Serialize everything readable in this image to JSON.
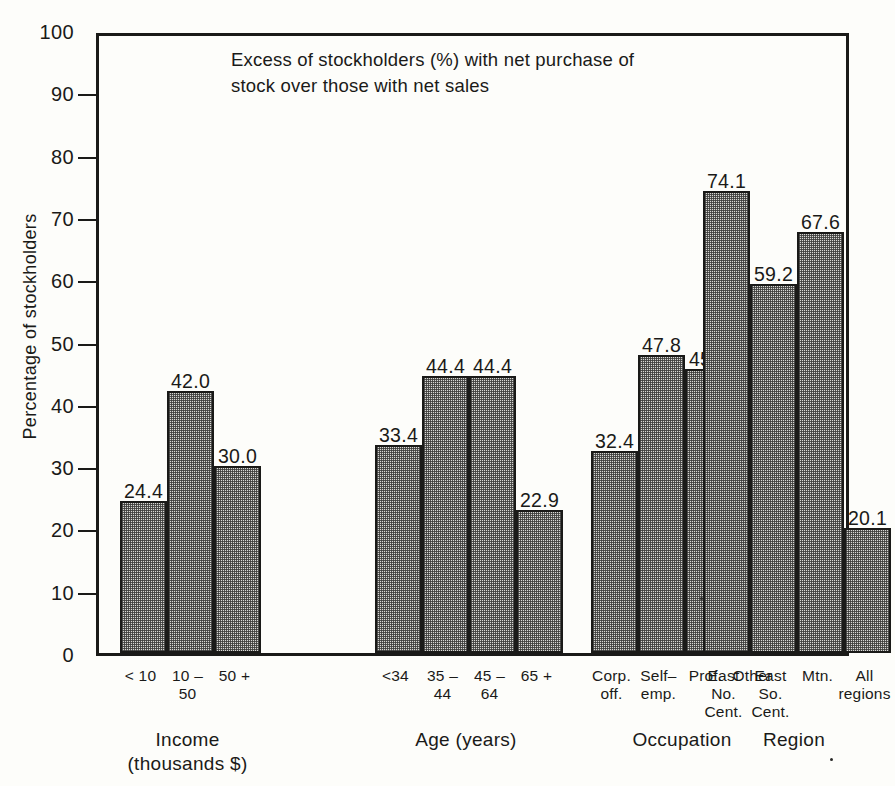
{
  "figure": {
    "title_lines": [
      "Excess of stockholders (%) with net purchase of",
      "stock over those with net sales"
    ],
    "y_axis_title": "Percentage of stockholders",
    "y_ticks": [
      "0",
      "10",
      "20",
      "30",
      "40",
      "50",
      "60",
      "70",
      "80",
      "90",
      "100"
    ],
    "colors": {
      "ink": "#1a1a18",
      "bar_fill": "#d8d8d4",
      "background": "#fdfdfa"
    }
  },
  "chart_data": {
    "type": "bar",
    "title": "Excess of stockholders (%) with net purchase of stock over those with net sales",
    "xlabel": "",
    "ylabel": "Percentage of stockholders",
    "ylim": [
      0,
      100
    ],
    "ytick_step": 10,
    "grid": false,
    "legend": "none",
    "groups": [
      {
        "name": "Income (thousands $)",
        "label_lines": [
          "Income",
          "(thousands $)"
        ],
        "categories": [
          "< 10",
          "10 – 50",
          "50 +"
        ],
        "category_lines": [
          [
            "< 10"
          ],
          [
            "10 –",
            "50"
          ],
          [
            "50 +"
          ]
        ],
        "values": [
          24.4,
          42.0,
          30.0
        ],
        "value_labels": [
          "24.4",
          "42.0",
          "30.0"
        ]
      },
      {
        "name": "Age (years)",
        "label_lines": [
          "Age (years)"
        ],
        "categories": [
          "<34",
          "35 – 44",
          "45 – 64",
          "65 +"
        ],
        "category_lines": [
          [
            "<34"
          ],
          [
            "35 –",
            "44"
          ],
          [
            "45 –",
            "64"
          ],
          [
            "65 +"
          ]
        ],
        "values": [
          33.4,
          44.4,
          44.4,
          22.9
        ],
        "value_labels": [
          "33.4",
          "44.4",
          "44.4",
          "22.9"
        ]
      },
      {
        "name": "Occupation",
        "label_lines": [
          "Occupation"
        ],
        "categories": [
          "Corp. off.",
          "Self– emp.",
          "Prof.",
          "Other"
        ],
        "category_lines": [
          [
            "Corp.",
            "off."
          ],
          [
            "Self–",
            "emp."
          ],
          [
            "Prof."
          ],
          [
            "Other"
          ]
        ],
        "values": [
          32.4,
          47.8,
          45.6,
          36.9
        ],
        "value_labels": [
          "32.4",
          "47.8",
          "45.6",
          "36.9"
        ]
      },
      {
        "name": "Region",
        "label_lines": [
          "Region"
        ],
        "categories": [
          "East No. Cent.",
          "East So. Cent.",
          "Mtn.",
          "All regions"
        ],
        "category_lines": [
          [
            "East",
            "No.",
            "Cent."
          ],
          [
            "East",
            "So.",
            "Cent."
          ],
          [
            "Mtn."
          ],
          [
            "All",
            "regions"
          ]
        ],
        "values": [
          74.1,
          59.2,
          67.6,
          20.1
        ],
        "value_labels": [
          "74.1",
          "59.2",
          "67.6",
          "20.1"
        ]
      }
    ]
  }
}
